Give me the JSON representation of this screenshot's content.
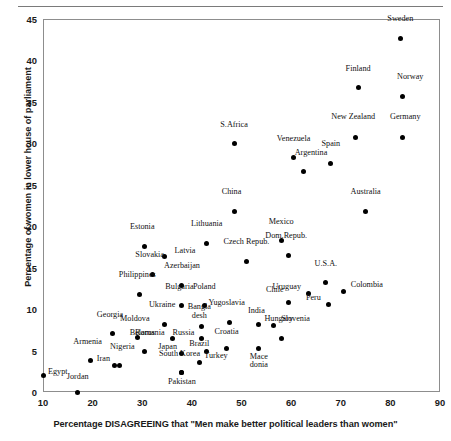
{
  "chart_data": {
    "type": "scatter",
    "title": "",
    "xlabel": "Percentage DISAGREEING that \"Men make better political leaders than women\"",
    "ylabel": "Percentage of women in lower house of parliament",
    "xlim": [
      10,
      90
    ],
    "ylim": [
      0,
      45
    ],
    "xticks": [
      10,
      20,
      30,
      40,
      50,
      60,
      70,
      80,
      90
    ],
    "yticks": [
      0,
      5,
      10,
      15,
      20,
      25,
      30,
      35,
      40,
      45
    ],
    "grid": false,
    "legend": "none",
    "point_color": "#000000",
    "frame_color": "#8d8d8d",
    "points": [
      {
        "label": "Sweden",
        "x": 82.0,
        "y": 42.7,
        "lx": 82.0,
        "ly": 44.6,
        "align": "c"
      },
      {
        "label": "Finland",
        "x": 73.5,
        "y": 36.7,
        "lx": 73.5,
        "ly": 38.6,
        "align": "c"
      },
      {
        "label": "Norway",
        "x": 82.5,
        "y": 35.6,
        "lx": 84.0,
        "ly": 37.6,
        "align": "c"
      },
      {
        "label": "New Zealand",
        "x": 73.0,
        "y": 30.7,
        "lx": 72.5,
        "ly": 32.8,
        "align": "c"
      },
      {
        "label": "Germany",
        "x": 82.5,
        "y": 30.7,
        "lx": 83.0,
        "ly": 32.8,
        "align": "c"
      },
      {
        "label": "S.Africa",
        "x": 48.5,
        "y": 30.0,
        "lx": 48.5,
        "ly": 31.9,
        "align": "c"
      },
      {
        "label": "Venezuela",
        "x": 60.5,
        "y": 28.3,
        "lx": 60.5,
        "ly": 30.2,
        "align": "c"
      },
      {
        "label": "Argentina",
        "x": 62.5,
        "y": 26.6,
        "lx": 64.0,
        "ly": 28.5,
        "align": "c"
      },
      {
        "label": "Spain",
        "x": 68.0,
        "y": 27.6,
        "lx": 68.0,
        "ly": 29.6,
        "align": "c"
      },
      {
        "label": "China",
        "x": 48.5,
        "y": 21.8,
        "lx": 48.0,
        "ly": 23.8,
        "align": "c"
      },
      {
        "label": "Australia",
        "x": 75.0,
        "y": 21.8,
        "lx": 75.0,
        "ly": 23.8,
        "align": "c"
      },
      {
        "label": "Mexico",
        "x": 58.0,
        "y": 18.3,
        "lx": 58.0,
        "ly": 20.2,
        "align": "c"
      },
      {
        "label": "Lithuania",
        "x": 43.0,
        "y": 17.9,
        "lx": 43.0,
        "ly": 19.9,
        "align": "c"
      },
      {
        "label": "Estonia",
        "x": 30.5,
        "y": 17.6,
        "lx": 30.0,
        "ly": 19.6,
        "align": "c"
      },
      {
        "label": "Dom.Repub.",
        "x": 59.5,
        "y": 16.5,
        "lx": 59.0,
        "ly": 18.4,
        "align": "c"
      },
      {
        "label": "Latvia",
        "x": 34.5,
        "y": 16.3,
        "lx": 36.5,
        "ly": 16.7,
        "align": "l"
      },
      {
        "label": "Czech Repub.",
        "x": 51.0,
        "y": 15.7,
        "lx": 51.0,
        "ly": 17.7,
        "align": "c"
      },
      {
        "label": "Slovakia",
        "x": 32.0,
        "y": 14.2,
        "lx": 31.5,
        "ly": 16.2,
        "align": "c"
      },
      {
        "label": "Azerbaijan",
        "x": 38.0,
        "y": 12.9,
        "lx": 38.0,
        "ly": 14.8,
        "align": "c"
      },
      {
        "label": "U.S.A.",
        "x": 67.0,
        "y": 13.2,
        "lx": 67.0,
        "ly": 15.1,
        "align": "c"
      },
      {
        "label": "Colombia",
        "x": 70.5,
        "y": 12.1,
        "lx": 72.0,
        "ly": 12.5,
        "align": "l"
      },
      {
        "label": "Philippines",
        "x": 29.5,
        "y": 11.8,
        "lx": 29.0,
        "ly": 13.8,
        "align": "c"
      },
      {
        "label": "Uruguay",
        "x": 63.5,
        "y": 11.9,
        "lx": 62.0,
        "ly": 12.3,
        "align": "r"
      },
      {
        "label": "Chile",
        "x": 59.5,
        "y": 10.8,
        "lx": 58.5,
        "ly": 11.9,
        "align": "r"
      },
      {
        "label": "Peru",
        "x": 67.5,
        "y": 10.6,
        "lx": 66.0,
        "ly": 11.0,
        "align": "r"
      },
      {
        "label": "Bulgaria",
        "x": 38.0,
        "y": 10.4,
        "lx": 37.5,
        "ly": 12.3,
        "align": "c"
      },
      {
        "label": "Poland",
        "x": 42.5,
        "y": 10.4,
        "lx": 42.5,
        "ly": 12.3,
        "align": "c"
      },
      {
        "label": "Yugoslavia",
        "x": 47.5,
        "y": 8.4,
        "lx": 47.0,
        "ly": 10.4,
        "align": "c"
      },
      {
        "label": "India",
        "x": 53.5,
        "y": 8.2,
        "lx": 53.0,
        "ly": 9.4,
        "align": "c"
      },
      {
        "label": "Slovenia",
        "x": 56.5,
        "y": 8.0,
        "lx": 58.0,
        "ly": 8.4,
        "align": "l"
      },
      {
        "label": "Bangla\ndesh",
        "x": 42.0,
        "y": 7.9,
        "lx": 41.5,
        "ly": 9.9,
        "align": "c"
      },
      {
        "label": "Ukraine",
        "x": 34.5,
        "y": 8.2,
        "lx": 34.0,
        "ly": 10.1,
        "align": "c"
      },
      {
        "label": "Georgia",
        "x": 24.0,
        "y": 7.0,
        "lx": 23.5,
        "ly": 8.9,
        "align": "c"
      },
      {
        "label": "Romania",
        "x": 36.0,
        "y": 6.4,
        "lx": 34.5,
        "ly": 6.8,
        "align": "r"
      },
      {
        "label": "Russia",
        "x": 42.0,
        "y": 6.4,
        "lx": 40.5,
        "ly": 6.8,
        "align": "r"
      },
      {
        "label": "Moldova",
        "x": 29.0,
        "y": 6.6,
        "lx": 28.5,
        "ly": 8.4,
        "align": "c"
      },
      {
        "label": "Hungary",
        "x": 58.0,
        "y": 6.5,
        "lx": 57.5,
        "ly": 8.4,
        "align": "c"
      },
      {
        "label": "Croatia",
        "x": 47.0,
        "y": 5.3,
        "lx": 47.0,
        "ly": 6.9,
        "align": "c"
      },
      {
        "label": "Brazil",
        "x": 43.0,
        "y": 4.9,
        "lx": 43.5,
        "ly": 5.4,
        "align": "r"
      },
      {
        "label": "Belarus",
        "x": 30.5,
        "y": 4.9,
        "lx": 30.0,
        "ly": 6.8,
        "align": "c"
      },
      {
        "label": "Japan",
        "x": 38.0,
        "y": 4.7,
        "lx": 37.0,
        "ly": 5.1,
        "align": "r"
      },
      {
        "label": "Mace\ndonia",
        "x": 53.5,
        "y": 5.2,
        "lx": 53.5,
        "ly": 3.9,
        "align": "c"
      },
      {
        "label": "Turkey",
        "x": 41.5,
        "y": 3.6,
        "lx": 42.5,
        "ly": 4.0,
        "align": "l"
      },
      {
        "label": "Armenia",
        "x": 19.5,
        "y": 3.8,
        "lx": 19.0,
        "ly": 5.7,
        "align": "c"
      },
      {
        "label": "Nigeria",
        "x": 25.5,
        "y": 3.2,
        "lx": 26.0,
        "ly": 5.1,
        "align": "c"
      },
      {
        "label": "Iran",
        "x": 24.5,
        "y": 3.2,
        "lx": 23.5,
        "ly": 3.6,
        "align": "r"
      },
      {
        "label": "South Korea",
        "x": 38.0,
        "y": 2.3,
        "lx": 37.5,
        "ly": 4.2,
        "align": "c"
      },
      {
        "label": "Egypt",
        "x": 10.0,
        "y": 2.0,
        "lx": 11.0,
        "ly": 2.0,
        "align": "l"
      },
      {
        "label": "Pakistan",
        "x": 38.0,
        "y": 2.3,
        "lx": 38.0,
        "ly": 0.9,
        "align": "c"
      },
      {
        "label": "Jordan",
        "x": 17.0,
        "y": 0.0,
        "lx": 17.0,
        "ly": 1.4,
        "align": "c"
      }
    ]
  }
}
